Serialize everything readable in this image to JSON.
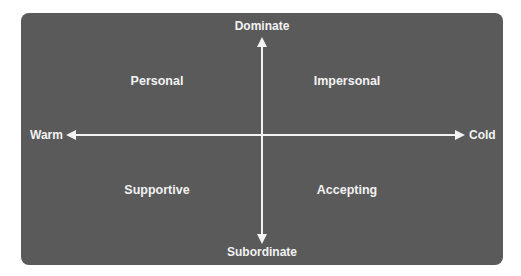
{
  "diagram": {
    "type": "quadrant-chart",
    "colors": {
      "background": "#ffffff",
      "panel": "#5a5a5a",
      "foreground": "#f2f2f2"
    },
    "axes": {
      "vertical": {
        "top": "Dominate",
        "bottom": "Subordinate"
      },
      "horizontal": {
        "left": "Warm",
        "right": "Cold"
      }
    },
    "quadrants": {
      "top_left": "Personal",
      "top_right": "Impersonal",
      "bottom_left": "Supportive",
      "bottom_right": "Accepting"
    }
  }
}
